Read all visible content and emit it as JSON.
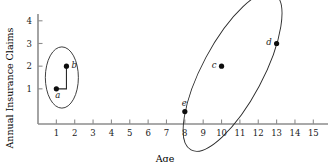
{
  "chart_data": {
    "type": "scatter",
    "title": "",
    "xlabel": "Age",
    "ylabel": "Annual Insurance Claims",
    "xlim": [
      0,
      15.8
    ],
    "ylim": [
      -0.55,
      4.3
    ],
    "grid": false,
    "legend": null,
    "xticks": [
      "1",
      "2",
      "3",
      "4",
      "5",
      "6",
      "7",
      "8",
      "9",
      "10",
      "11",
      "12",
      "13",
      "14",
      "15"
    ],
    "xtick_values": [
      1,
      2,
      3,
      4,
      5,
      6,
      7,
      8,
      9,
      10,
      11,
      12,
      13,
      14,
      15
    ],
    "yticks": [
      "1",
      "2",
      "3",
      "4"
    ],
    "ytick_values": [
      1,
      2,
      3,
      4
    ],
    "points": [
      {
        "label": "a",
        "x": 1,
        "y": 1,
        "label_pos": "below"
      },
      {
        "label": "b",
        "x": 1.55,
        "y": 2,
        "label_pos": "right"
      },
      {
        "label": "c",
        "x": 10,
        "y": 2,
        "label_pos": "left"
      },
      {
        "label": "d",
        "x": 13,
        "y": 3,
        "label_pos": "left"
      },
      {
        "label": "e",
        "x": 8,
        "y": 0,
        "label_pos": "above"
      }
    ],
    "connectors": [
      {
        "from": "a",
        "to": "b",
        "style": "elbow"
      }
    ],
    "clusters": [
      {
        "name": "cluster-left",
        "members": [
          "a",
          "b"
        ],
        "shape": "ellipse",
        "cx": 1.3,
        "cy": 1.5,
        "rx": 0.9,
        "ry": 1.35,
        "rotation": 0
      },
      {
        "name": "cluster-right",
        "members": [
          "c",
          "d",
          "e"
        ],
        "shape": "ellipse",
        "cx": 10.6,
        "cy": 1.75,
        "rx": 1.65,
        "ry": 3.9,
        "rotation": 28
      }
    ],
    "point_color": "#0d0d0d",
    "axis_color": "#8d8d8d",
    "outline_color": "#2a2a2a"
  }
}
